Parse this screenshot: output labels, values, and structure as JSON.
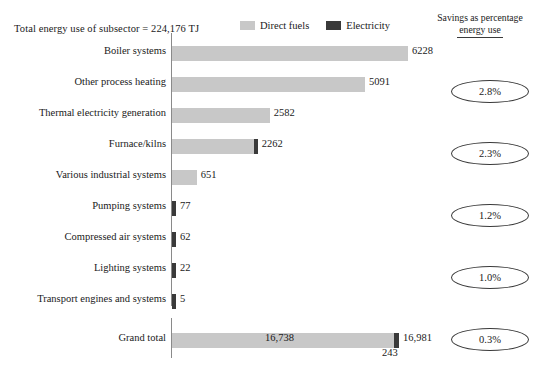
{
  "header": {
    "total_note": "Total energy use of subsector = 224,176 TJ",
    "savings_head_line1": "Savings as percentage",
    "savings_head_line2": "energy use"
  },
  "legend": {
    "items": [
      {
        "label": "Direct fuels",
        "color": "#c8c8c8",
        "icon": "square-swatch"
      },
      {
        "label": "Electricity",
        "color": "#3a3a3a",
        "icon": "square-swatch"
      }
    ]
  },
  "chart_data": {
    "type": "bar",
    "orientation": "horizontal",
    "stacked": true,
    "title": "Total energy use of subsector = 224,176 TJ",
    "xlabel": "",
    "ylabel": "",
    "grid": false,
    "legend_position": "top",
    "categories": [
      "Boiler systems",
      "Other process heating",
      "Thermal electricity generation",
      "Furnace/kilns",
      "Various industrial systems",
      "Pumping systems",
      "Compressed air systems",
      "Lighting systems",
      "Transport engines and systems"
    ],
    "series": [
      {
        "name": "Direct fuels",
        "color": "#c8c8c8",
        "values": [
          6228,
          5091,
          2582,
          2262,
          651,
          0,
          0,
          0,
          0
        ]
      },
      {
        "name": "Electricity",
        "color": "#3a3a3a",
        "values": [
          0,
          0,
          0,
          0,
          0,
          77,
          62,
          22,
          5
        ]
      }
    ],
    "bar_labels": [
      "6228",
      "5091",
      "2582",
      "2262",
      "651",
      "77",
      "62",
      "22",
      "5"
    ],
    "savings_percent": [
      "2.8%",
      "2.3%",
      "1.2%",
      "1.0%",
      "0.3%",
      "0.0%",
      "0.0%",
      "0.0%",
      "0.0%"
    ],
    "total_row": {
      "label": "Grand total",
      "direct_fuels": 16738,
      "direct_fuels_label": "16,738",
      "electricity": 243,
      "electricity_label": "243",
      "total_label": "16,981",
      "savings_percent": "7.6%"
    },
    "xlim": [
      0,
      16981
    ]
  }
}
